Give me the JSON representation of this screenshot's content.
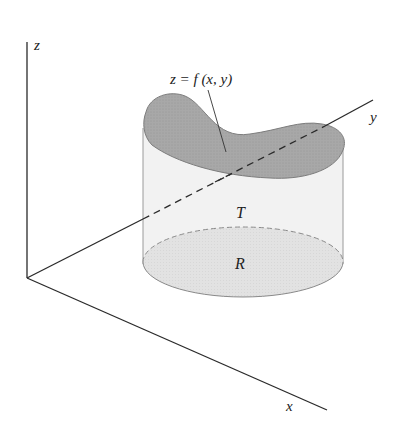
{
  "figure": {
    "axes": {
      "z_label": "z",
      "y_label": "y",
      "x_label": "x"
    },
    "surface_label": "z = f (x, y)",
    "solid_label": "T",
    "region_label": "R"
  },
  "colors": {
    "axis": "#2a2a2a",
    "surface_fill": "#a9a9a9",
    "cylinder_fill": "#f1f1f1",
    "region_fill": "#e3e3e3",
    "outline": "#8a8a8a"
  }
}
